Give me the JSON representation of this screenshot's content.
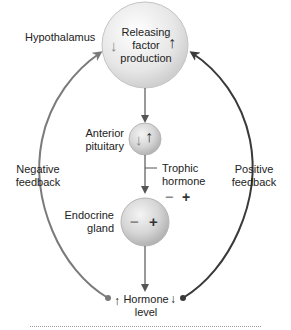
{
  "hypothalamus": {
    "label": "Hypothalamus",
    "node_text": [
      "Releasing",
      "factor",
      "production"
    ],
    "arrow_left": "↓",
    "arrow_right": "↑"
  },
  "anterior_pituitary": {
    "label_lines": [
      "Anterior",
      "pituitary"
    ],
    "arrow_left": "↓",
    "arrow_right": "↑"
  },
  "trophic_hormone": {
    "label_lines": [
      "Trophic",
      "hormone"
    ],
    "minus": "−",
    "plus": "+"
  },
  "endocrine_gland": {
    "label_lines": [
      "Endocrine",
      "gland"
    ],
    "minus": "−",
    "plus": "+"
  },
  "negative_feedback": {
    "label_lines": [
      "Negative",
      "feedback"
    ]
  },
  "positive_feedback": {
    "label_lines": [
      "Positive",
      "feedback"
    ]
  },
  "hormone_level": {
    "label_lines": [
      "Hormone",
      "level"
    ],
    "arrow_left": "↑",
    "arrow_right": "↓"
  },
  "colors": {
    "node_fill": "#ececec",
    "node_stroke": "#bdbdbd",
    "negative_arrow": "#7a7a7a",
    "positive_arrow": "#3a3a3a",
    "main_arrow": "#555555"
  }
}
